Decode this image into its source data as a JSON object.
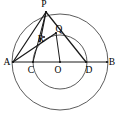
{
  "figure": {
    "canvas": {
      "width": 117,
      "height": 119,
      "background": "#ffffff"
    },
    "center": {
      "x": 60,
      "y": 62
    },
    "circles": [
      {
        "name": "outer-circle",
        "cx": 60,
        "cy": 62,
        "r": 48,
        "stroke": "#4a4a4a"
      },
      {
        "name": "inner-circle",
        "cx": 60,
        "cy": 62,
        "r": 27,
        "stroke": "#4a4a4a"
      }
    ],
    "points": {
      "A": {
        "x": 13,
        "y": 62,
        "label": "A",
        "lx": 7,
        "ly": 63
      },
      "B": {
        "x": 107,
        "y": 62,
        "label": "B",
        "lx": 112,
        "ly": 63
      },
      "C": {
        "x": 33,
        "y": 62,
        "label": "C",
        "lx": 31,
        "ly": 71
      },
      "D": {
        "x": 86,
        "y": 62,
        "label": "D",
        "lx": 87,
        "ly": 71
      },
      "O": {
        "x": 60,
        "y": 62,
        "label": "O",
        "lx": 58,
        "ly": 71
      },
      "P": {
        "x": 46,
        "y": 12,
        "label": "P",
        "lx": 44,
        "ly": 5
      },
      "Q": {
        "x": 56,
        "y": 33,
        "label": "Q",
        "lx": 59,
        "ly": 30
      },
      "R": {
        "x": 44,
        "y": 37,
        "label": "R",
        "lx": 41,
        "ly": 40
      }
    },
    "segments": [
      {
        "name": "segment-AB",
        "from": "A",
        "to": "B",
        "style": "thin"
      },
      {
        "name": "segment-AP",
        "from": "A",
        "to": "P",
        "style": "thick"
      },
      {
        "name": "segment-PD",
        "from": "P",
        "to": "D",
        "style": "thick"
      },
      {
        "name": "segment-AQ",
        "from": "A",
        "to": "Q",
        "style": "thick"
      },
      {
        "name": "segment-PR",
        "from": "P",
        "to": "R",
        "style": "thick"
      },
      {
        "name": "segment-QO",
        "from": "Q",
        "to": "O",
        "style": "thin"
      },
      {
        "name": "segment-PC",
        "from": "P",
        "to": "C",
        "style": "thin"
      }
    ],
    "labels_order": [
      "P",
      "Q",
      "R",
      "A",
      "C",
      "O",
      "D",
      "B"
    ]
  }
}
